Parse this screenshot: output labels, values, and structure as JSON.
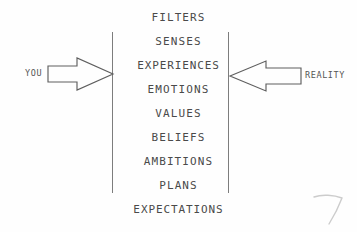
{
  "diagram": {
    "background_color": "#fefefe",
    "ink_color": "#4a4a4a",
    "line_color": "#7d7d7d",
    "left_label": "YOU",
    "right_label": "REALITY",
    "left_arrow_direction": "right",
    "right_arrow_direction": "left",
    "filters": [
      {
        "label": "FILTERS"
      },
      {
        "label": "SENSES"
      },
      {
        "label": "EXPERIENCES"
      },
      {
        "label": "EMOTIONS"
      },
      {
        "label": "VALUES"
      },
      {
        "label": "BELIEFS"
      },
      {
        "label": "AMBITIONS"
      },
      {
        "label": "PLANS"
      },
      {
        "label": "EXPECTATIONS"
      }
    ],
    "barriers": [
      {
        "name": "left-barrier"
      },
      {
        "name": "right-barrier"
      }
    ],
    "stray_mark": "pencil-squiggle"
  }
}
